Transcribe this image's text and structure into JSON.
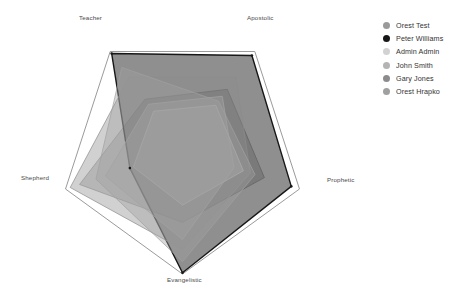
{
  "chart_data": {
    "type": "radar",
    "title": "",
    "categories": [
      "Apostolic",
      "Prophetic",
      "Evangelistic",
      "Shepherd",
      "Teacher"
    ],
    "axis_count": 5,
    "grid": false,
    "legend_position": "right",
    "rmax": 100,
    "series": [
      {
        "name": "Orest Test",
        "color": "#9a9a9a",
        "fill": "rgba(150,150,150,0.42)",
        "values": [
          62,
          70,
          58,
          88,
          52
        ]
      },
      {
        "name": "Peter Williams",
        "color": "#171717",
        "fill": "rgba(40,40,40,0.52)",
        "values": [
          96,
          93,
          99,
          45,
          98
        ]
      },
      {
        "name": "Admin Admin",
        "color": "#d2d2d2",
        "fill": "rgba(205,205,205,0.38)",
        "values": [
          46,
          52,
          44,
          42,
          40
        ]
      },
      {
        "name": "John Smith",
        "color": "#b4b4b4",
        "fill": "rgba(180,180,180,0.40)",
        "values": [
          55,
          44,
          72,
          66,
          47
        ]
      },
      {
        "name": "Gary Jones",
        "color": "#8c8c8c",
        "fill": "rgba(140,140,140,0.40)",
        "values": [
          74,
          58,
          80,
          96,
          74
        ]
      },
      {
        "name": "Orest Hrapko",
        "color": "#a0a0a0",
        "fill": "rgba(160,160,160,0.40)",
        "values": [
          50,
          62,
          90,
          74,
          84
        ]
      }
    ],
    "outline": {
      "name": "outer-boundary",
      "color": "#8e8e8e",
      "values": [
        100,
        100,
        100,
        100,
        100
      ]
    }
  },
  "chart": {
    "labels": [
      {
        "text": "Teacher",
        "x": 79,
        "y": 14
      },
      {
        "text": "Apostolic",
        "x": 247,
        "y": 14
      },
      {
        "text": "Prophetic",
        "x": 327,
        "y": 176
      },
      {
        "text": "Evangelistic",
        "x": 167,
        "y": 276
      },
      {
        "text": "Shepherd",
        "x": 21,
        "y": 174
      }
    ]
  },
  "legend": {
    "items": [
      {
        "label": "Orest Test",
        "color": "#9a9a9a"
      },
      {
        "label": "Peter Williams",
        "color": "#171717"
      },
      {
        "label": "Admin Admin",
        "color": "#d2d2d2"
      },
      {
        "label": "John Smith",
        "color": "#b4b4b4"
      },
      {
        "label": "Gary Jones",
        "color": "#8c8c8c"
      },
      {
        "label": "Orest Hrapko",
        "color": "#a0a0a0"
      }
    ]
  }
}
